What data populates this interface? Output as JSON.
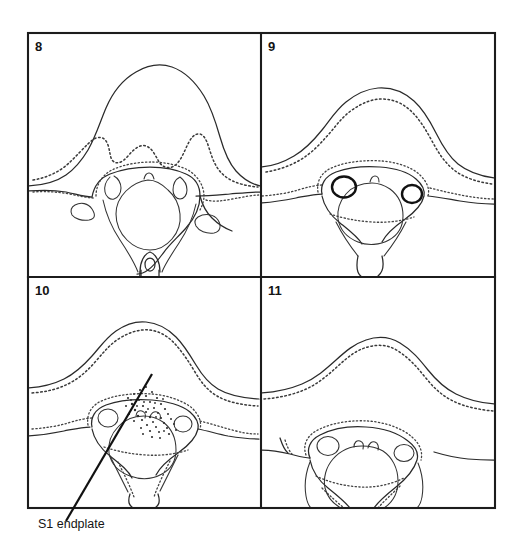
{
  "figure": {
    "background_color": "#ffffff",
    "ink_color": "#1c1c1c",
    "frame": {
      "x": 28,
      "y": 33,
      "width": 467,
      "height": 475
    },
    "grid": {
      "rows": 2,
      "cols": 2,
      "divider_x": 261,
      "divider_y": 277
    },
    "panels": [
      {
        "id": "panel-8",
        "number": "8",
        "number_x": 35,
        "number_y": 51,
        "description": "axial cross-section tracing with broad vertebral body, dotted inner cortical outline, open spinal canal and long spinous process"
      },
      {
        "id": "panel-9",
        "number": "9",
        "number_x": 268,
        "number_y": 51,
        "description": "axial cross-section tracing with flatter body, paired dark foraminal rings and short spinous process"
      },
      {
        "id": "panel-10",
        "number": "10",
        "number_x": 35,
        "number_y": 295,
        "description": "axial cross-section tracing with stippled density region and S1 endplate reference line"
      },
      {
        "id": "panel-11",
        "number": "11",
        "number_x": 268,
        "number_y": 295,
        "description": "axial cross-section tracing with low broad body, paired foramina and notched lateral masses"
      }
    ],
    "annotations": [
      {
        "id": "s1-endplate-callout",
        "label": "S1 endplate",
        "label_x": 38,
        "label_y": 528,
        "line_from": {
          "x": 152,
          "y": 374
        },
        "line_to": {
          "x": 66,
          "y": 521
        }
      }
    ]
  }
}
